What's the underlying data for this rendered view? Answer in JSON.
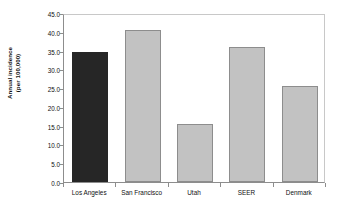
{
  "chart_data": {
    "type": "bar",
    "title": "",
    "subtitle": "",
    "xlabel": "",
    "ylabel": "Annual incidence (per 100,000)",
    "ylabel_lines": [
      "Annual incidence",
      "(per 100,000)"
    ],
    "categories": [
      "Los Angeles",
      "San Francisco",
      "Utah",
      "SEER",
      "Denmark"
    ],
    "values": [
      34.6,
      40.4,
      15.4,
      35.9,
      25.5
    ],
    "ylim": [
      0.0,
      45.0
    ],
    "ytick_labels": [
      "0.0",
      "5.0",
      "10.0",
      "15.0",
      "20.0",
      "25.0",
      "30.0",
      "35.0",
      "40.0",
      "45.0"
    ],
    "ytick_values": [
      0.0,
      5.0,
      10.0,
      15.0,
      20.0,
      25.0,
      30.0,
      35.0,
      40.0,
      45.0
    ],
    "grid": false,
    "legend": null,
    "bar_colors": [
      "#262626",
      "#c2c2c2",
      "#c2c2c2",
      "#c2c2c2",
      "#c2c2c2"
    ],
    "bar_border_colors": [
      "#262626",
      "#8d8d8d",
      "#8d8d8d",
      "#8d8d8d",
      "#8d8d8d"
    ],
    "highlighted_category": "Los Angeles",
    "background_color": "#ffffff",
    "axis_color": "#8d8d8d",
    "text_color": "#111111"
  }
}
